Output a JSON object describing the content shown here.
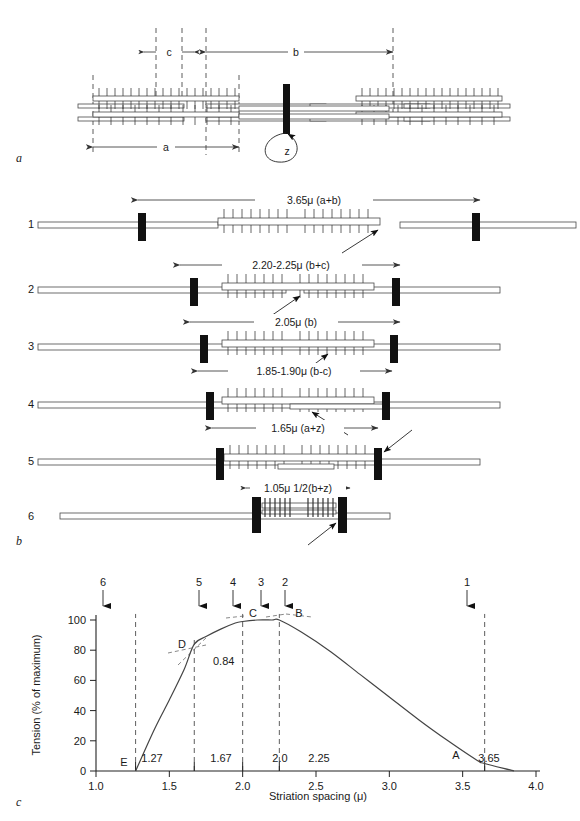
{
  "figure": {
    "panels": [
      {
        "id": "a",
        "letter": "a"
      },
      {
        "id": "b",
        "letter": "b"
      },
      {
        "id": "c",
        "letter": "c"
      }
    ]
  },
  "panel_a": {
    "letter": "a",
    "dimension_labels": [
      {
        "name": "c",
        "text": "c"
      },
      {
        "name": "b",
        "text": "b"
      },
      {
        "name": "a",
        "text": "a"
      },
      {
        "name": "z",
        "text": "z"
      }
    ]
  },
  "panel_b": {
    "letter": "b",
    "rows": [
      {
        "number": "1",
        "dimension": "3.65μ (a+b)"
      },
      {
        "number": "2",
        "dimension": "2.20-2.25μ (b+c)"
      },
      {
        "number": "3",
        "dimension": "2.05μ (b)"
      },
      {
        "number": "4",
        "dimension": "1.85-1.90μ (b-c)"
      },
      {
        "number": "5",
        "dimension": "1.65μ (a+z)"
      },
      {
        "number": "6",
        "dimension": "1.05μ 1/2(b+z)"
      }
    ]
  },
  "panel_c": {
    "letter": "c",
    "top_arrows": [
      {
        "label": "6",
        "x": 1.05
      },
      {
        "label": "5",
        "x": 1.67
      },
      {
        "label": "4",
        "x": 1.87
      },
      {
        "label": "3",
        "x": 2.05
      },
      {
        "label": "2",
        "x": 2.2
      },
      {
        "label": "1",
        "x": 3.65
      }
    ]
  },
  "chart_data": {
    "type": "line",
    "title": "",
    "xlabel": "Striation spacing (μ)",
    "ylabel": "Tension (% of maximum)",
    "xlim": [
      1.0,
      4.0
    ],
    "ylim": [
      0,
      100
    ],
    "xticks": [
      "1.0",
      "1.5",
      "2.0",
      "2.5",
      "3.0",
      "3.5",
      "4.0"
    ],
    "xtick_values": [
      1.0,
      1.5,
      2.0,
      2.5,
      3.0,
      3.5,
      4.0
    ],
    "yticks": [
      "0",
      "20",
      "40",
      "60",
      "80",
      "100"
    ],
    "ytick_values": [
      0,
      20,
      40,
      60,
      80,
      100
    ],
    "grid": false,
    "legend": "none",
    "series": [
      {
        "name": "Tension vs striation spacing",
        "x": [
          1.27,
          1.4,
          1.5,
          1.6,
          1.67,
          1.75,
          1.85,
          1.95,
          2.0,
          2.1,
          2.2,
          2.25,
          2.4,
          2.6,
          2.8,
          3.0,
          3.2,
          3.4,
          3.6,
          3.65,
          3.85
        ],
        "y": [
          0,
          28,
          47,
          67,
          84,
          89,
          94,
          98,
          99,
          100,
          100,
          100,
          92,
          79,
          64,
          49,
          34,
          20,
          7,
          5,
          0
        ]
      }
    ],
    "annotations": [
      {
        "label": "E",
        "x": 1.27,
        "value": "1.27",
        "tension": 0
      },
      {
        "label": "D",
        "x": 1.67,
        "value": "1.67",
        "tension": 84,
        "extra_value": "0.84"
      },
      {
        "label": "C",
        "x": 2.0,
        "value": "2.0",
        "tension": 100
      },
      {
        "label": "B",
        "x": 2.25,
        "value": "2.25",
        "tension": 100
      },
      {
        "label": "A",
        "x": 3.65,
        "value": "3.65",
        "tension": 0
      }
    ],
    "vertical_markers": [
      "1.27",
      "1.67",
      "2.0",
      "2.25",
      "3.65"
    ],
    "inflection_label": "0.84"
  }
}
